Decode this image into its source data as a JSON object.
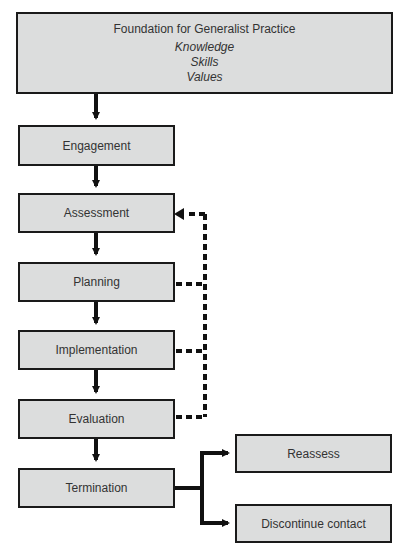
{
  "diagram": {
    "foundation": {
      "title": "Foundation for Generalist Practice",
      "items": [
        "Knowledge",
        "Skills",
        "Values"
      ]
    },
    "steps": [
      {
        "label": "Engagement"
      },
      {
        "label": "Assessment"
      },
      {
        "label": "Planning"
      },
      {
        "label": "Implementation"
      },
      {
        "label": "Evaluation"
      },
      {
        "label": "Termination"
      }
    ],
    "outcomes": [
      {
        "label": "Reassess"
      },
      {
        "label": "Discontinue contact"
      }
    ],
    "colors": {
      "box_fill": "#dcdddd",
      "border": "#1a1a1a",
      "text": "#333333"
    }
  }
}
